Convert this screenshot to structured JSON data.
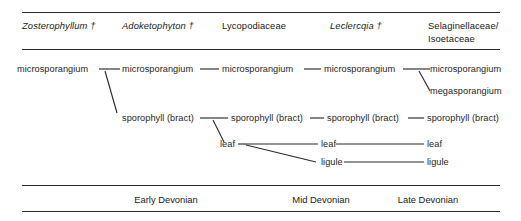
{
  "figure": {
    "type": "homology-table-diagram",
    "ink_color": "#2b2b2b",
    "text_color": "#262626"
  },
  "header": {
    "columns": [
      {
        "label": "Zosterophyllum †",
        "style": "italic"
      },
      {
        "label": "Adoketophyton †",
        "style": "italic"
      },
      {
        "label": "Lycopodiaceae",
        "style": "roman"
      },
      {
        "label": "Leclercqia †",
        "style": "italic"
      },
      {
        "label": "Selaginellaceae/\nIsoetaceae",
        "style": "roman"
      }
    ]
  },
  "nodes": {
    "col1": [
      {
        "label": "microsporangium"
      }
    ],
    "col2": [
      {
        "label": "microsporangium"
      },
      {
        "label": "sporophyll (bract)"
      }
    ],
    "col3": [
      {
        "label": "microsporangium"
      },
      {
        "label": "sporophyll (bract)"
      },
      {
        "label": "leaf"
      }
    ],
    "col4": [
      {
        "label": "microsporangium"
      },
      {
        "label": "sporophyll (bract)"
      },
      {
        "label": "leaf"
      },
      {
        "label": "ligule"
      }
    ],
    "col5": [
      {
        "label": "microsporangium"
      },
      {
        "label": "megasporangium"
      },
      {
        "label": "sporophyll (bract)"
      },
      {
        "label": "leaf"
      },
      {
        "label": "ligule"
      }
    ]
  },
  "footer": {
    "epochs": [
      {
        "label": "Early Devonian"
      },
      {
        "label": "Mid Devonian"
      },
      {
        "label": "Late Devonian"
      }
    ]
  }
}
